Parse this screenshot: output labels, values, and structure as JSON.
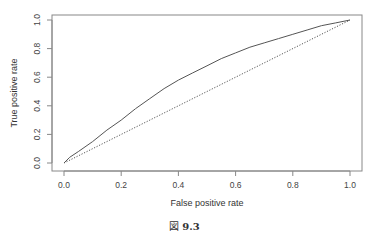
{
  "figure": {
    "caption_prefix": "図",
    "caption_number": "9.3"
  },
  "chart_data": {
    "type": "line",
    "title": "",
    "xlabel": "False positive rate",
    "ylabel": "True positive rate",
    "xlim": [
      0,
      1
    ],
    "ylim": [
      0,
      1
    ],
    "grid": false,
    "legend": null,
    "x_ticks": [
      "0.0",
      "0.2",
      "0.4",
      "0.6",
      "0.8",
      "1.0"
    ],
    "y_ticks": [
      "0.0",
      "0.2",
      "0.4",
      "0.6",
      "0.8",
      "1.0"
    ],
    "series": [
      {
        "name": "ROC curve",
        "style": "solid",
        "color": "#555555",
        "x": [
          0.0,
          0.02,
          0.05,
          0.1,
          0.15,
          0.2,
          0.25,
          0.3,
          0.35,
          0.4,
          0.45,
          0.5,
          0.55,
          0.6,
          0.65,
          0.7,
          0.75,
          0.8,
          0.85,
          0.9,
          0.95,
          1.0
        ],
        "y": [
          0.0,
          0.04,
          0.08,
          0.15,
          0.23,
          0.3,
          0.38,
          0.45,
          0.52,
          0.58,
          0.63,
          0.68,
          0.73,
          0.77,
          0.81,
          0.84,
          0.87,
          0.9,
          0.93,
          0.96,
          0.98,
          1.0
        ]
      },
      {
        "name": "Random baseline",
        "style": "dotted",
        "color": "#555555",
        "x": [
          0.0,
          1.0
        ],
        "y": [
          0.0,
          1.0
        ]
      }
    ]
  }
}
